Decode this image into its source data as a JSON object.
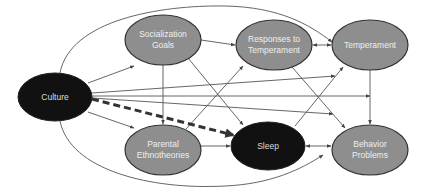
{
  "diagram": {
    "colors": {
      "dark_node": "#111111",
      "gray_node": "#8e8e8e",
      "node_stroke": "#333333",
      "edge": "#555555",
      "dashed_edge": "#333333"
    },
    "nodes": [
      {
        "id": "culture",
        "lines": [
          "Culture"
        ],
        "fill": "dark"
      },
      {
        "id": "socialization_goals",
        "lines": [
          "Socialization",
          "Goals"
        ],
        "fill": "gray"
      },
      {
        "id": "responses_to_temperament",
        "lines": [
          "Responses to",
          "Temperament"
        ],
        "fill": "gray"
      },
      {
        "id": "temperament",
        "lines": [
          "Temperament"
        ],
        "fill": "gray"
      },
      {
        "id": "parental_ethnotheories",
        "lines": [
          "Parental",
          "Ethnotheories"
        ],
        "fill": "gray"
      },
      {
        "id": "sleep",
        "lines": [
          "Sleep"
        ],
        "fill": "dark"
      },
      {
        "id": "behavior_problems",
        "lines": [
          "Behavior",
          "Problems"
        ],
        "fill": "gray"
      }
    ],
    "edges": [
      {
        "from": "culture",
        "to": "socialization_goals",
        "style": "solid"
      },
      {
        "from": "culture",
        "to": "parental_ethnotheories",
        "style": "solid"
      },
      {
        "from": "culture",
        "to": "sleep",
        "style": "dashed"
      },
      {
        "from": "culture",
        "to": "temperament",
        "style": "curved"
      },
      {
        "from": "culture",
        "to": "sleep",
        "style": "curved"
      },
      {
        "from": "culture",
        "to": "behavior_problems",
        "style": "solid"
      },
      {
        "from": "culture",
        "to": "temperament",
        "style": "solid"
      },
      {
        "from": "socialization_goals",
        "to": "responses_to_temperament",
        "style": "solid"
      },
      {
        "from": "socialization_goals",
        "to": "parental_ethnotheories",
        "style": "solid"
      },
      {
        "from": "socialization_goals",
        "to": "sleep",
        "style": "solid"
      },
      {
        "from": "responses_to_temperament",
        "to": "temperament",
        "style": "bidirectional"
      },
      {
        "from": "responses_to_temperament",
        "to": "behavior_problems",
        "style": "solid"
      },
      {
        "from": "parental_ethnotheories",
        "to": "sleep",
        "style": "solid"
      },
      {
        "from": "parental_ethnotheories",
        "to": "responses_to_temperament",
        "style": "solid"
      },
      {
        "from": "sleep",
        "to": "temperament",
        "style": "solid"
      },
      {
        "from": "sleep",
        "to": "behavior_problems",
        "style": "bidirectional"
      },
      {
        "from": "temperament",
        "to": "behavior_problems",
        "style": "solid"
      }
    ]
  },
  "labels": {
    "culture": "Culture",
    "socialization_goals_1": "Socialization",
    "socialization_goals_2": "Goals",
    "responses_1": "Responses to",
    "responses_2": "Temperament",
    "temperament": "Temperament",
    "parental_1": "Parental",
    "parental_2": "Ethnotheories",
    "sleep": "Sleep",
    "behavior_1": "Behavior",
    "behavior_2": "Problems"
  }
}
